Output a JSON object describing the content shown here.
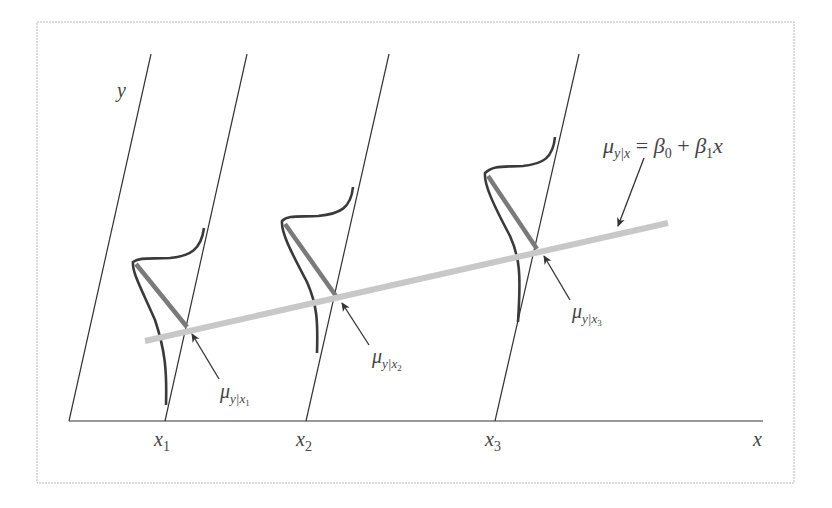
{
  "diagram": {
    "frame": {
      "x": 37,
      "y": 22,
      "width": 757,
      "height": 461,
      "stroke": "#b8b8b8"
    },
    "colors": {
      "axis": "#333333",
      "curve": "#3a3a3a",
      "mean_segment": "#7a7a7a",
      "regression_line": "#c8c8c8",
      "label": "#444444"
    },
    "axes": {
      "x_label": "x",
      "y_label": "y"
    },
    "x_ticks": [
      {
        "base": "x",
        "sub": "1"
      },
      {
        "base": "x",
        "sub": "2"
      },
      {
        "base": "x",
        "sub": "3"
      }
    ],
    "regression_equation": {
      "mu": "μ",
      "sub": "y|x",
      "rest_eq": " = ",
      "beta0": "β",
      "beta0_sub": "0",
      "plus": " + ",
      "beta1": "β",
      "beta1_sub": "1",
      "x": "x"
    },
    "mean_labels": [
      {
        "mu": "μ",
        "sub_y": "y|",
        "sub_x": "x",
        "sub_idx": "1"
      },
      {
        "mu": "μ",
        "sub_y": "y|",
        "sub_x": "x",
        "sub_idx": "2"
      },
      {
        "mu": "μ",
        "sub_y": "y|",
        "sub_x": "x",
        "sub_idx": "3"
      }
    ]
  }
}
